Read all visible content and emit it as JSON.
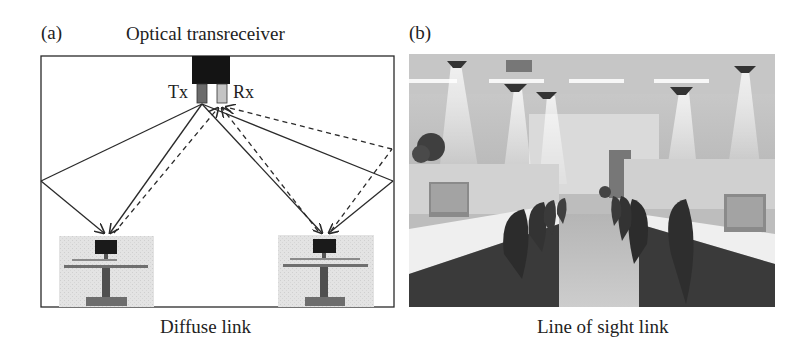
{
  "figure": {
    "panel_a": {
      "tag": "(a)",
      "title": "Optical transreceiver",
      "tx_label": "Tx",
      "rx_label": "Rx",
      "caption": "Diffuse link",
      "elements": [
        "room-outline",
        "optical-transceiver",
        "transmitter",
        "receiver",
        "left-desk-workstation",
        "right-desk-workstation"
      ],
      "ray_legend": {
        "solid": "transmitted rays (Tx to desks via direct and wall reflection)",
        "dashed": "received rays (desks to Rx via direct and wall reflection)"
      }
    },
    "panel_b": {
      "tag": "(b)",
      "caption": "Line of sight link",
      "description": "Office photo with ceiling-mounted optical transceivers beaming light cones down to workstations"
    },
    "colors": {
      "line": "#2a2a2a",
      "transceiver_body": "#141414",
      "tx_stick": "#6b6b6b",
      "rx_stick": "#c4c4c4",
      "desk_image_bg": "#e2e2e2",
      "background": "#ffffff"
    }
  }
}
